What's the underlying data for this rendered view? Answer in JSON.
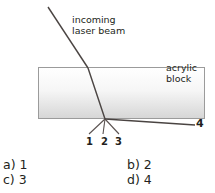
{
  "diagram": {
    "incoming_label": "incoming\nlaser beam",
    "block_label": "acrylic\nblock",
    "ray_numbers": [
      "1",
      "2",
      "3"
    ],
    "exit_ray_label": "4",
    "colors": {
      "ink": "#231f20",
      "ray": "#4a4442",
      "block_border": "#9b9b9b",
      "block_fill_top": "#ffffff",
      "block_fill_bottom": "#d9d9d9",
      "page_background": "#ffffff"
    },
    "geometry": {
      "block": {
        "x": 38,
        "y": 67,
        "width": 167,
        "height": 52
      },
      "incoming_beam": {
        "from": [
          48,
          7
        ],
        "to": [
          88,
          68
        ]
      },
      "beam_in_block": {
        "from": [
          88,
          68
        ],
        "to": [
          105,
          119
        ]
      },
      "exit_point": [
        105,
        119
      ],
      "ray1": {
        "from": [
          105,
          119
        ],
        "to": [
          90,
          134
        ]
      },
      "ray2": {
        "from": [
          105,
          119
        ],
        "to": [
          103,
          134
        ]
      },
      "ray3": {
        "from": [
          105,
          119
        ],
        "to": [
          119,
          134
        ]
      },
      "ray4": {
        "from": [
          105,
          119
        ],
        "to": [
          195,
          125
        ]
      }
    }
  },
  "question": {
    "options": [
      {
        "key": "a)",
        "value": "1"
      },
      {
        "key": "b)",
        "value": "2"
      },
      {
        "key": "c)",
        "value": "3"
      },
      {
        "key": "d)",
        "value": "4"
      }
    ],
    "option_a_text": "a) 1",
    "option_b_text": "b) 2",
    "option_c_text": "c) 3",
    "option_d_text": "d) 4"
  }
}
